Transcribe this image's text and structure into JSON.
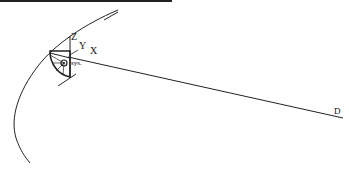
{
  "caption": {
    "visible": "clipped",
    "note_visible_text": ""
  },
  "diagram": {
    "labels": {
      "z_axis": "Z",
      "y_axis": "Y",
      "x_axis": "X",
      "coord_sys": "sys.",
      "target_point": "D"
    },
    "colors": {
      "stroke": "#222222",
      "background": "#ffffff"
    }
  }
}
